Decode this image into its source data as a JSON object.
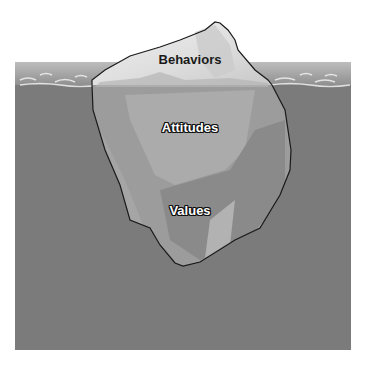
{
  "diagram": {
    "layers": [
      {
        "label": "Behaviors",
        "region": "above-water",
        "x": 190,
        "y": 59
      },
      {
        "label": "Attitudes",
        "region": "below-water-upper",
        "x": 190,
        "y": 127
      },
      {
        "label": "Values",
        "region": "below-water-lower",
        "x": 190,
        "y": 210
      }
    ],
    "colors": {
      "sky": "#9a9a9a",
      "water": "#7b7b7b",
      "ice_above": "#e4e4e4",
      "ice_below": "#9c9c9c",
      "ice_below_light": "#a9a9a9",
      "ice_below_dark": "#8a8a8a",
      "outline": "#1a1a1a"
    }
  }
}
